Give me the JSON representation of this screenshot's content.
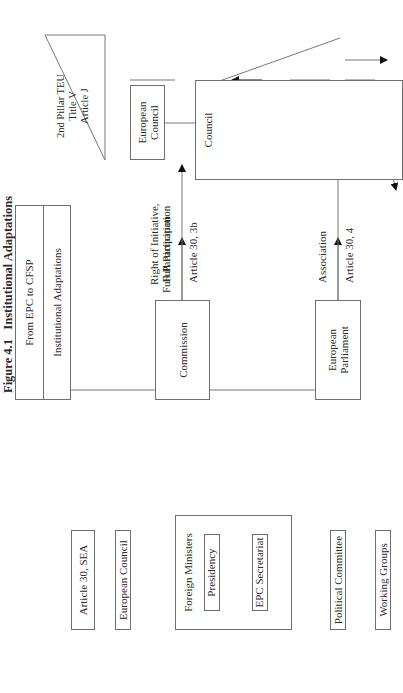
{
  "figure": {
    "number": "Figure 4.1",
    "title": "Institutional Adaptations"
  },
  "header": {
    "line1": "From EPC to CFSP",
    "line2": "Institutional Adaptations"
  },
  "left_side": {
    "article": "Article 30, SEA",
    "european_council": "European Council",
    "foreign_ministers": "Foreign Ministers",
    "presidency": "Presidency",
    "epc_secretariat": "EPC Secretariat",
    "political_committee": "Political Committee",
    "working_groups": "Working Groups"
  },
  "center": {
    "commission": "Commission",
    "european_parliament_line1": "European",
    "european_parliament_line2": "Parliament",
    "left_upper_label": "Full Participation",
    "left_upper_article": "Article 30, 3b",
    "left_lower_label": "Association",
    "left_lower_article": "Article 30, 4",
    "right_upper_label_line1": "Right of Initiative,",
    "right_upper_label_line2": "Full Participation",
    "right_upper_article": "Article J.9",
    "right_lower_label": "Association",
    "right_lower_article": "Article J.7"
  },
  "right_side": {
    "pillar_line1": "2nd Pillar TEU",
    "pillar_line2": "Title V",
    "pillar_line3": "Article J",
    "european_council": "European Council",
    "council": "Council",
    "presidency": "Presidency",
    "cfsp_line1": "CFSP Unit,",
    "cfsp_line2": "Secretariat-",
    "cfsp_line3": "General",
    "coreper_line1": "Committee of",
    "coreper_line2": "Permanent",
    "coreper_line3": "Representatives",
    "coreper_line4": "(COREPER)",
    "working_parties": "Working Parties",
    "political_committee_line1": "Political",
    "political_committee_line2": "Committee"
  }
}
